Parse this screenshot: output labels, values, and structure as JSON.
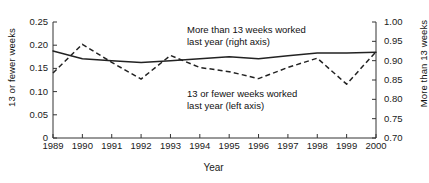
{
  "chart_data": {
    "type": "line",
    "title": "",
    "xlabel": "Year",
    "categories": [
      "1989",
      "1990",
      "1991",
      "1992",
      "1993",
      "1994",
      "1995",
      "1996",
      "1997",
      "1998",
      "1999",
      "2000"
    ],
    "x": [
      1989,
      1990,
      1991,
      1992,
      1993,
      1994,
      1995,
      1996,
      1997,
      1998,
      1999,
      2000
    ],
    "grid": false,
    "legend_position": "inline-annotations",
    "axes": {
      "left": {
        "label": "13 or fewer weeks",
        "ylim": [
          0,
          0.25
        ],
        "ticks": [
          0,
          0.05,
          0.1,
          0.15,
          0.2,
          0.25
        ],
        "tick_labels": [
          "0",
          "0.05",
          "0.10",
          "0.15",
          "0.20",
          "0.25"
        ]
      },
      "right": {
        "label": "More than 13 weeks",
        "ylim": [
          0.7,
          1.0
        ],
        "ticks": [
          0.7,
          0.75,
          0.8,
          0.85,
          0.9,
          0.95,
          1.0
        ],
        "tick_labels": [
          "0.70",
          "0.75",
          "0.80",
          "0.85",
          "0.90",
          "0.95",
          "1.00"
        ]
      }
    },
    "series": [
      {
        "name": "More than 13 weeks worked last year (right axis)",
        "axis": "right",
        "style": "solid",
        "color": "#222222",
        "values": [
          0.925,
          0.905,
          0.9,
          0.895,
          0.9,
          0.905,
          0.91,
          0.905,
          0.913,
          0.92,
          0.92,
          0.922
        ]
      },
      {
        "name": "13 or fewer weeks worked last year (left axis)",
        "axis": "left",
        "style": "dashed",
        "color": "#222222",
        "values": [
          0.14,
          0.202,
          0.163,
          0.127,
          0.178,
          0.152,
          0.143,
          0.128,
          0.152,
          0.172,
          0.116,
          0.186
        ]
      }
    ],
    "annotations": [
      {
        "id": "more",
        "line1": "More than 13 weeks worked",
        "line2": "last year (right axis)"
      },
      {
        "id": "fewer",
        "line1": "13 or fewer weeks worked",
        "line2": "last year (left axis)"
      }
    ]
  }
}
